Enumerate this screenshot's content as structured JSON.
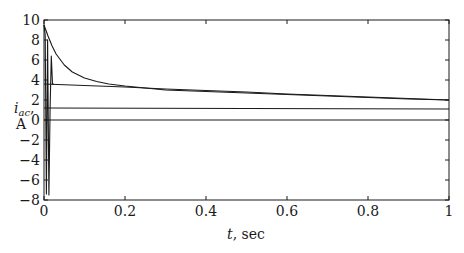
{
  "chart_data": {
    "type": "line",
    "title": "",
    "xlabel": "t, sec",
    "ylabel": "i_ac, A",
    "ylabel_main": "i",
    "ylabel_sub": "ac",
    "ylabel_suffix": ",",
    "ylabel_unit": "A",
    "xlabel_var": "t",
    "xlabel_unit": ", sec",
    "xlim": [
      0,
      1
    ],
    "ylim": [
      -8,
      10
    ],
    "grid": false,
    "legend": "none",
    "x_ticks": [
      0,
      0.2,
      0.4,
      0.6,
      0.8,
      1
    ],
    "x_tick_labels": [
      "0",
      "0.2",
      "0.4",
      "0.6",
      "0.8",
      "1"
    ],
    "y_ticks": [
      -8,
      -6,
      -4,
      -2,
      0,
      2,
      4,
      6,
      8,
      10
    ],
    "y_tick_labels": [
      "−8",
      "−6",
      "−4",
      "−2",
      "0",
      "2",
      "4",
      "6",
      "8",
      "10"
    ],
    "series": [
      {
        "name": "upper envelope (total decaying)",
        "x": [
          0,
          0.01,
          0.02,
          0.03,
          0.05,
          0.07,
          0.1,
          0.13,
          0.16,
          0.2,
          0.3,
          0.4,
          0.5,
          0.6,
          0.7,
          0.8,
          0.9,
          1.0
        ],
        "values": [
          9.5,
          8.4,
          7.4,
          6.6,
          5.5,
          4.8,
          4.2,
          3.85,
          3.6,
          3.4,
          3.0,
          2.85,
          2.7,
          2.55,
          2.4,
          2.25,
          2.1,
          2.0
        ]
      },
      {
        "name": "slow decaying component",
        "x": [
          0,
          0.1,
          0.2,
          0.3,
          0.4,
          0.5,
          0.6,
          0.7,
          0.8,
          0.9,
          1.0
        ],
        "values": [
          3.6,
          3.45,
          3.3,
          3.1,
          2.95,
          2.8,
          2.6,
          2.45,
          2.3,
          2.15,
          2.0
        ]
      },
      {
        "name": "steady component",
        "x": [
          0,
          1.0
        ],
        "values": [
          1.2,
          1.1
        ]
      },
      {
        "name": "zero line",
        "x": [
          0,
          1.0
        ],
        "values": [
          0,
          0
        ]
      },
      {
        "name": "initial oscillation",
        "x": [
          0,
          0.003,
          0.006,
          0.009,
          0.012,
          0.015,
          0.018,
          0.021,
          0.024
        ],
        "values": [
          9.5,
          8.5,
          -7.4,
          8.0,
          -7.5,
          1.2,
          6.4,
          3.6,
          3.6
        ]
      }
    ],
    "colors": {
      "line": "#1a1a1a",
      "axis": "#1a1a1a",
      "background": "#ffffff"
    }
  }
}
